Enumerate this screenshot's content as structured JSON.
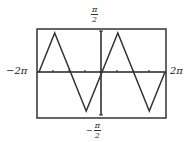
{
  "chart_data": {
    "type": "line",
    "title": "",
    "function": "y = arcsin(sin x)",
    "xlabel": "",
    "ylabel": "",
    "xlim": [
      "-2π",
      "2π"
    ],
    "ylim": [
      "-π/2",
      "π/2"
    ],
    "x_tick_labels": {
      "left": "−2π",
      "right": "2π"
    },
    "y_tick_labels": {
      "top_num": "π",
      "top_den": "2",
      "bottom_sign": "−",
      "bottom_num": "π",
      "bottom_den": "2"
    },
    "grid": false,
    "series": [
      {
        "name": "arcsin(sin x)",
        "x": [
          -6.2832,
          -4.7124,
          -1.5708,
          1.5708,
          4.7124,
          6.2832
        ],
        "y": [
          0,
          1.5708,
          -1.5708,
          1.5708,
          -1.5708,
          0
        ]
      }
    ],
    "x_ticks_count": 8
  }
}
